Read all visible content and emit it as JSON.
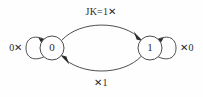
{
  "diagram": {
    "type": "finite-state-machine",
    "title_text": "",
    "background_color": "#fefefe",
    "stroke_color": "#3a3a3a",
    "text_color": "#2a2a2a",
    "states": [
      {
        "id": "s0",
        "label": "0",
        "cx": 52,
        "cy": 48,
        "r": 12
      },
      {
        "id": "s1",
        "label": "1",
        "cx": 150,
        "cy": 48,
        "r": 12
      }
    ],
    "transitions": [
      {
        "id": "t-self-0",
        "from": "s0",
        "to": "s0",
        "kind": "self-loop",
        "side": "left",
        "label": "0✕",
        "label_x": 16,
        "label_y": 48
      },
      {
        "id": "t-0-to-1",
        "from": "s0",
        "to": "s1",
        "kind": "arc-top",
        "label": "JK=1✕",
        "label_x": 101,
        "label_y": 13
      },
      {
        "id": "t-1-to-0",
        "from": "s1",
        "to": "s0",
        "kind": "arc-bottom",
        "label": "✕1",
        "label_x": 101,
        "label_y": 84
      },
      {
        "id": "t-self-1",
        "from": "s1",
        "to": "s1",
        "kind": "self-loop",
        "side": "right",
        "label": "✕0",
        "label_x": 187,
        "label_y": 48
      }
    ]
  }
}
